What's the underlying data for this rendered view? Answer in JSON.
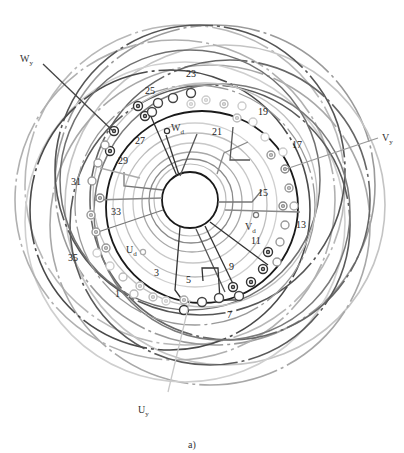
{
  "figure": {
    "caption": "a)",
    "type": "stator winding diagram (three-phase, 36 slots)",
    "colors": {
      "phase_dark": "#444444",
      "phase_mid": "#777777",
      "phase_light": "#b5b5b5",
      "hub_circle": "#222222",
      "background": "#ffffff"
    }
  },
  "terminals": {
    "Wy": {
      "label": "W",
      "sub": "y"
    },
    "Vy": {
      "label": "V",
      "sub": "y"
    },
    "Uy": {
      "label": "U",
      "sub": "y"
    },
    "Wd": {
      "label": "W",
      "sub": "d"
    },
    "Vd": {
      "label": "V",
      "sub": "d"
    },
    "Ud": {
      "label": "U",
      "sub": "d"
    }
  },
  "slot_labels": [
    {
      "text": "1",
      "x": 115,
      "y": 297
    },
    {
      "text": "3",
      "x": 154,
      "y": 276
    },
    {
      "text": "5",
      "x": 186,
      "y": 283
    },
    {
      "text": "7",
      "x": 227,
      "y": 318
    },
    {
      "text": "9",
      "x": 229,
      "y": 270
    },
    {
      "text": "11",
      "x": 251,
      "y": 244
    },
    {
      "text": "13",
      "x": 296,
      "y": 228
    },
    {
      "text": "15",
      "x": 258,
      "y": 196
    },
    {
      "text": "17",
      "x": 292,
      "y": 148
    },
    {
      "text": "19",
      "x": 258,
      "y": 115
    },
    {
      "text": "21",
      "x": 212,
      "y": 135
    },
    {
      "text": "23",
      "x": 186,
      "y": 77
    },
    {
      "text": "25",
      "x": 145,
      "y": 94
    },
    {
      "text": "27",
      "x": 135,
      "y": 144
    },
    {
      "text": "29",
      "x": 118,
      "y": 164
    },
    {
      "text": "31",
      "x": 71,
      "y": 185
    },
    {
      "text": "33",
      "x": 111,
      "y": 215
    },
    {
      "text": "35",
      "x": 68,
      "y": 261
    }
  ]
}
